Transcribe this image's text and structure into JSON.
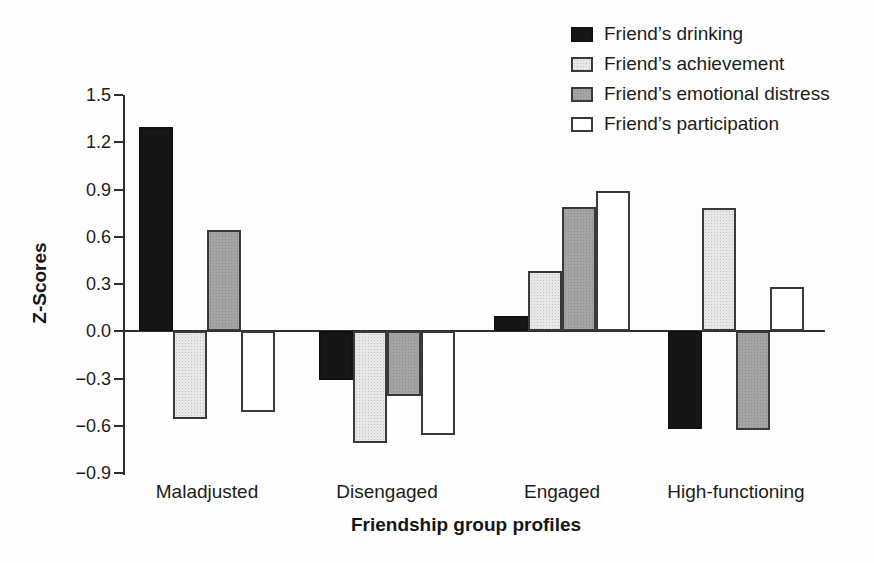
{
  "figure": {
    "background": "#fefefe",
    "axis_color": "#2e2e2e",
    "text_color": "#1c1c1c"
  },
  "chart_data": {
    "type": "bar",
    "title": "",
    "xlabel": "Friendship group profiles",
    "ylabel": "Z-Scores",
    "ylim": [
      -0.9,
      1.5
    ],
    "ytick_step": 0.3,
    "grid": false,
    "legend_position": "top-right",
    "yticks": [
      {
        "label": "1.5",
        "value": 1.5
      },
      {
        "label": "1.2",
        "value": 1.2
      },
      {
        "label": "0.9",
        "value": 0.9
      },
      {
        "label": "0.6",
        "value": 0.6
      },
      {
        "label": "0.3",
        "value": 0.3
      },
      {
        "label": "0.0",
        "value": 0.0
      },
      {
        "label": "−0.3",
        "value": -0.3
      },
      {
        "label": "−0.6",
        "value": -0.6
      },
      {
        "label": "−0.9",
        "value": -0.9
      }
    ],
    "categories": [
      "Maladjusted",
      "Disengaged",
      "Engaged",
      "High-functioning"
    ],
    "series": [
      {
        "name": "Friend’s drinking",
        "color": "#161616",
        "border": "#111111",
        "textured": false,
        "values": [
          1.3,
          -0.31,
          0.1,
          -0.62
        ]
      },
      {
        "name": "Friend’s achievement",
        "color": "#e7e7e7",
        "border": "#3a3a3a",
        "textured": true,
        "values": [
          -0.56,
          -0.71,
          0.38,
          0.78
        ]
      },
      {
        "name": "Friend’s emotional distress",
        "color": "#a4a4a4",
        "border": "#3a3a3a",
        "textured": true,
        "values": [
          0.64,
          -0.41,
          0.79,
          -0.63
        ]
      },
      {
        "name": "Friend’s participation",
        "color": "#ffffff",
        "border": "#3a3a3a",
        "textured": false,
        "values": [
          -0.51,
          -0.66,
          0.89,
          0.28
        ]
      }
    ]
  }
}
